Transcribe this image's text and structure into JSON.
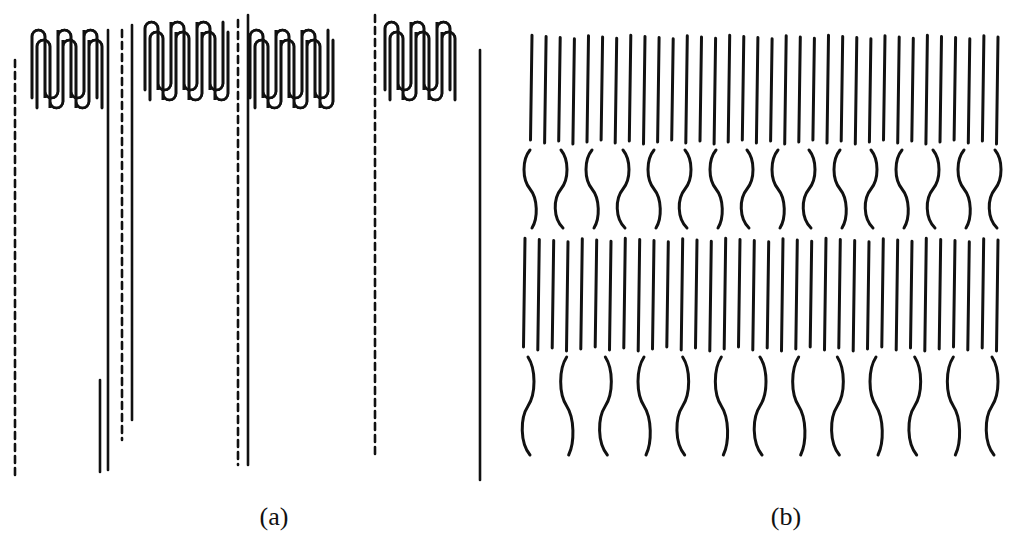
{
  "figure": {
    "panel_a": {
      "label": "(a)",
      "description": "folded-chain lamellae with tie chains (dashed) between lamellar stacks",
      "label_x": 274
    },
    "panel_b": {
      "label": "(b)",
      "description": "alternating crystalline (straight chains) and amorphous (wavy chains) layers",
      "label_x": 786
    },
    "colors": {
      "ink": "#111111",
      "background": "#ffffff"
    }
  }
}
